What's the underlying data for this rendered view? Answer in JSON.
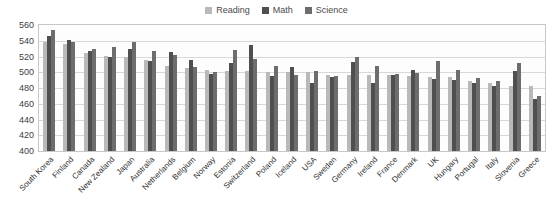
{
  "chart_data": {
    "type": "bar",
    "title": "",
    "subtitle": "",
    "xlabel": "",
    "ylabel": "",
    "ylim": [
      400,
      560
    ],
    "ytick_step": 20,
    "yticks": [
      560,
      540,
      520,
      500,
      480,
      460,
      440,
      420,
      400
    ],
    "grid": true,
    "legend_position": "top-center",
    "categories": [
      "South Korea",
      "Finland",
      "Canada",
      "New Zealand",
      "Japan",
      "Australia",
      "Netherlands",
      "Belgium",
      "Norway",
      "Estonia",
      "Switzerland",
      "Poland",
      "Iceland",
      "USA",
      "Sweden",
      "Germany",
      "Ireland",
      "France",
      "Denmark",
      "UK",
      "Hungary",
      "Portugal",
      "Italy",
      "Slovenia",
      "Greece"
    ],
    "series": [
      {
        "name": "Reading",
        "color": "#b9b9b9",
        "values": [
          539,
          536,
          524,
          521,
          520,
          515,
          508,
          506,
          503,
          501,
          501,
          500,
          500,
          500,
          497,
          497,
          496,
          496,
          495,
          494,
          494,
          489,
          486,
          483,
          483
        ]
      },
      {
        "name": "Math",
        "color": "#4f4f4f",
        "values": [
          546,
          541,
          527,
          519,
          529,
          514,
          526,
          515,
          498,
          512,
          534,
          495,
          507,
          487,
          494,
          513,
          487,
          497,
          503,
          492,
          490,
          487,
          483,
          501,
          466
        ]
      },
      {
        "name": "Science",
        "color": "#6d6d6d",
        "values": [
          554,
          538,
          529,
          532,
          539,
          527,
          522,
          507,
          500,
          528,
          517,
          508,
          496,
          502,
          495,
          520,
          508,
          498,
          499,
          514,
          503,
          493,
          489,
          512,
          470
        ]
      }
    ]
  },
  "legend": {
    "items": [
      {
        "label": "Reading",
        "color": "#b9b9b9"
      },
      {
        "label": "Math",
        "color": "#4f4f4f"
      },
      {
        "label": "Science",
        "color": "#6d6d6d"
      }
    ]
  }
}
